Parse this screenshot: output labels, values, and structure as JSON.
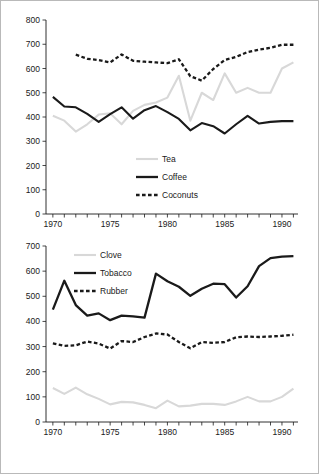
{
  "figure": {
    "background": "#ffffff",
    "border_color": "#b9b9b9",
    "axis_color": "#1a1a1a"
  },
  "colors": {
    "light_gray": "#d8d8d8",
    "black": "#1a1a1a"
  },
  "chart_data": [
    {
      "id": "top",
      "type": "line",
      "title": "",
      "xlabel": "",
      "ylabel": "",
      "xlim": [
        1969.4,
        1991.4
      ],
      "ylim": [
        0,
        800
      ],
      "grid": false,
      "legend_position": "center",
      "xticks": [
        1970,
        1971,
        1972,
        1973,
        1974,
        1975,
        1976,
        1977,
        1978,
        1979,
        1980,
        1981,
        1982,
        1983,
        1984,
        1985,
        1986,
        1987,
        1988,
        1989,
        1990,
        1991
      ],
      "xticklabels": [
        {
          "value": 1970,
          "label": "1970"
        },
        {
          "value": 1975,
          "label": "1975"
        },
        {
          "value": 1980,
          "label": "1980"
        },
        {
          "value": 1985,
          "label": "1985"
        },
        {
          "value": 1990,
          "label": "1990"
        }
      ],
      "yticks": [
        0,
        100,
        200,
        300,
        400,
        500,
        600,
        700,
        800
      ],
      "yticklabels": [
        "0",
        "100",
        "200",
        "300",
        "400",
        "500",
        "600",
        "700",
        "800"
      ],
      "series": [
        {
          "name": "Tea",
          "style": "solid",
          "color": "#d8d8d8",
          "width": 2.1,
          "x": [
            1970,
            1971,
            1972,
            1973,
            1974,
            1975,
            1976,
            1977,
            1978,
            1979,
            1980,
            1981,
            1982,
            1983,
            1984,
            1985,
            1986,
            1987,
            1988,
            1989,
            1990,
            1991
          ],
          "values": [
            405,
            385,
            340,
            370,
            410,
            415,
            370,
            425,
            450,
            460,
            480,
            570,
            385,
            500,
            470,
            580,
            500,
            520,
            500,
            500,
            600,
            625
          ]
        },
        {
          "name": "Coffee",
          "style": "solid",
          "color": "#1a1a1a",
          "width": 2.1,
          "x": [
            1970,
            1971,
            1972,
            1973,
            1974,
            1975,
            1976,
            1977,
            1978,
            1979,
            1980,
            1981,
            1982,
            1983,
            1984,
            1985,
            1986,
            1987,
            1988,
            1989,
            1990,
            1991
          ],
          "values": [
            483,
            443,
            440,
            413,
            380,
            412,
            440,
            393,
            428,
            445,
            420,
            392,
            345,
            375,
            362,
            332,
            370,
            405,
            373,
            380,
            383,
            383
          ]
        },
        {
          "name": "Coconuts",
          "style": "dashed",
          "color": "#1a1a1a",
          "width": 2.3,
          "x": [
            1972,
            1973,
            1974,
            1975,
            1976,
            1977,
            1978,
            1979,
            1980,
            1981,
            1982,
            1983,
            1984,
            1985,
            1986,
            1987,
            1988,
            1989,
            1990,
            1991
          ],
          "values": [
            657,
            640,
            635,
            625,
            658,
            632,
            628,
            625,
            622,
            638,
            568,
            550,
            598,
            635,
            648,
            668,
            678,
            685,
            698,
            698
          ]
        }
      ]
    },
    {
      "id": "bottom",
      "type": "line",
      "title": "",
      "xlabel": "",
      "ylabel": "",
      "xlim": [
        1969.4,
        1991.4
      ],
      "ylim": [
        0,
        700
      ],
      "grid": false,
      "legend_position": "upper-left",
      "xticks": [
        1970,
        1971,
        1972,
        1973,
        1974,
        1975,
        1976,
        1977,
        1978,
        1979,
        1980,
        1981,
        1982,
        1983,
        1984,
        1985,
        1986,
        1987,
        1988,
        1989,
        1990,
        1991
      ],
      "xticklabels": [
        {
          "value": 1970,
          "label": "1970"
        },
        {
          "value": 1975,
          "label": "1975"
        },
        {
          "value": 1980,
          "label": "1980"
        },
        {
          "value": 1985,
          "label": "1985"
        },
        {
          "value": 1990,
          "label": "1990"
        }
      ],
      "yticks": [
        0,
        100,
        200,
        300,
        400,
        500,
        600,
        700
      ],
      "yticklabels": [
        "0",
        "100",
        "200",
        "300",
        "400",
        "500",
        "600",
        "700"
      ],
      "series": [
        {
          "name": "Clove",
          "style": "solid",
          "color": "#d8d8d8",
          "width": 2.1,
          "x": [
            1970,
            1971,
            1972,
            1973,
            1974,
            1975,
            1976,
            1977,
            1978,
            1979,
            1980,
            1981,
            1982,
            1983,
            1984,
            1985,
            1986,
            1987,
            1988,
            1989,
            1990,
            1991
          ],
          "values": [
            135,
            112,
            137,
            110,
            92,
            70,
            80,
            78,
            68,
            55,
            85,
            62,
            65,
            72,
            72,
            68,
            82,
            100,
            82,
            82,
            100,
            133
          ]
        },
        {
          "name": "Tobacco",
          "style": "solid",
          "color": "#1a1a1a",
          "width": 2.3,
          "x": [
            1970,
            1971,
            1972,
            1973,
            1974,
            1975,
            1976,
            1977,
            1978,
            1979,
            1980,
            1981,
            1982,
            1983,
            1984,
            1985,
            1986,
            1987,
            1988,
            1989,
            1990,
            1991
          ],
          "values": [
            447,
            562,
            465,
            423,
            432,
            405,
            423,
            420,
            415,
            590,
            560,
            538,
            502,
            530,
            550,
            548,
            495,
            540,
            620,
            652,
            658,
            660
          ]
        },
        {
          "name": "Rubber",
          "style": "dashed",
          "color": "#1a1a1a",
          "width": 2.3,
          "x": [
            1970,
            1971,
            1972,
            1973,
            1974,
            1975,
            1976,
            1977,
            1978,
            1979,
            1980,
            1981,
            1982,
            1983,
            1984,
            1985,
            1986,
            1987,
            1988,
            1989,
            1990,
            1991
          ],
          "values": [
            313,
            303,
            305,
            320,
            312,
            292,
            322,
            318,
            338,
            352,
            348,
            318,
            293,
            318,
            315,
            318,
            337,
            340,
            338,
            340,
            343,
            347
          ]
        }
      ]
    }
  ],
  "legends": {
    "top": [
      {
        "label": "Tea",
        "style": "solid",
        "color": "#d8d8d8"
      },
      {
        "label": "Coffee",
        "style": "solid",
        "color": "#1a1a1a"
      },
      {
        "label": "Coconuts",
        "style": "dashed",
        "color": "#1a1a1a"
      }
    ],
    "bottom": [
      {
        "label": "Clove",
        "style": "solid",
        "color": "#d8d8d8"
      },
      {
        "label": "Tobacco",
        "style": "solid",
        "color": "#1a1a1a"
      },
      {
        "label": "Rubber",
        "style": "dashed",
        "color": "#1a1a1a"
      }
    ]
  }
}
